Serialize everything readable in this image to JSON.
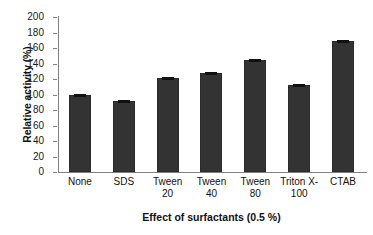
{
  "chart_data": {
    "type": "bar",
    "title": "",
    "categories": [
      "None",
      "SDS",
      "Tween 20",
      "Tween 40",
      "Tween 80",
      "Triton X-100",
      "CTAB"
    ],
    "category_lines": [
      [
        "None"
      ],
      [
        "SDS"
      ],
      [
        "Tween",
        "20"
      ],
      [
        "Tween",
        "40"
      ],
      [
        "Tween",
        "80"
      ],
      [
        "Triton X-",
        "100"
      ],
      [
        "CTAB"
      ]
    ],
    "values": [
      100,
      92,
      121,
      128,
      145,
      112,
      169
    ],
    "errors": [
      1.5,
      2,
      2,
      2,
      2,
      1.5,
      2
    ],
    "xlabel": "Effect of surfactants (0.5 %)",
    "ylabel": "Relative activity (%)",
    "ylim": [
      0,
      200
    ],
    "ytick_step": 20,
    "yticks": [
      0,
      20,
      40,
      60,
      80,
      100,
      120,
      140,
      160,
      180,
      200
    ],
    "grid": false,
    "legend": false,
    "bar_color": "#333333",
    "axis_color": "#808080",
    "text_color": "#111111"
  }
}
